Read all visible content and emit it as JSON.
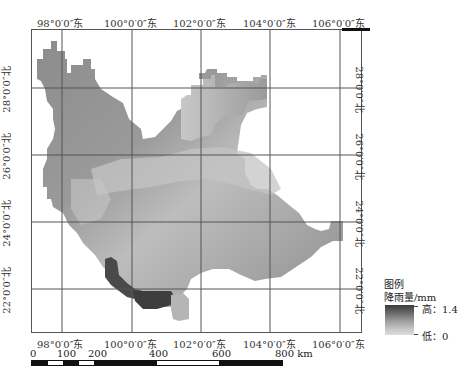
{
  "map": {
    "longitude_labels": [
      "98°0′0″东",
      "100°0′0″东",
      "102°0′0″东",
      "104°0′0″东",
      "106°0′0″东"
    ],
    "latitude_labels": [
      "28°0′0″北",
      "26°0′0″北",
      "24°0′0″北",
      "22°0′0″北"
    ]
  },
  "legend": {
    "title": "图例",
    "variable": "降雨量/mm",
    "high_label": "高：1.4",
    "low_label": "低：0",
    "high_color": "#3a3a3a",
    "low_color": "#dcdcdc"
  },
  "scale_bar": {
    "labels": [
      "0",
      "100",
      "200",
      "400",
      "600",
      "800 km"
    ]
  }
}
